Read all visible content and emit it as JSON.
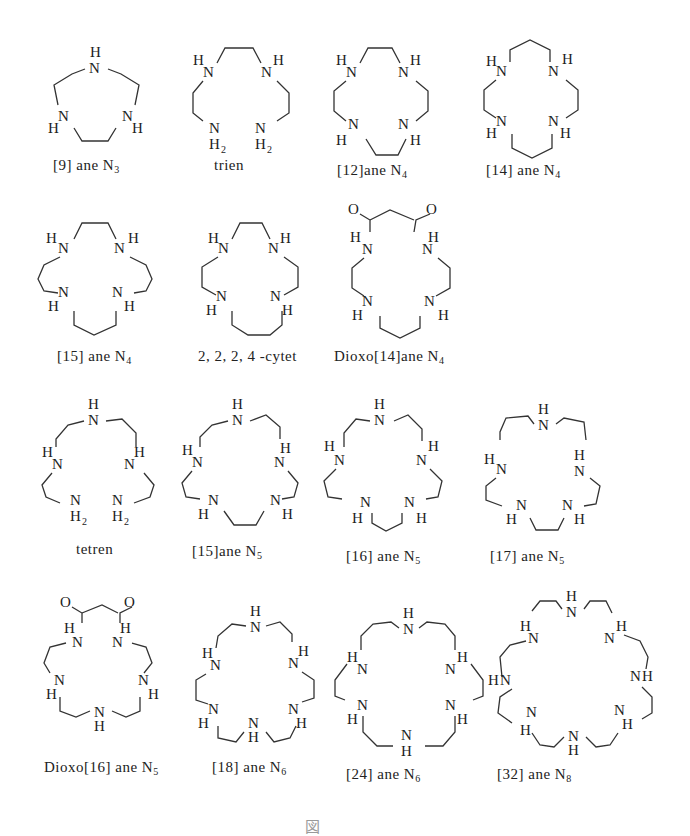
{
  "figure": {
    "rows": [
      {
        "compounds": [
          {
            "id": "9aneN3",
            "prefix": "[9] ane N",
            "sub": "3"
          },
          {
            "id": "trien",
            "prefix": "trien",
            "sub": ""
          },
          {
            "id": "12aneN4",
            "prefix": "[12]ane N",
            "sub": "4"
          },
          {
            "id": "14aneN4",
            "prefix": "[14] ane N",
            "sub": "4"
          }
        ]
      },
      {
        "compounds": [
          {
            "id": "15aneN4",
            "prefix": "[15] ane N",
            "sub": "4"
          },
          {
            "id": "cytet",
            "prefix": "2, 2, 2, 4 -cytet",
            "sub": ""
          },
          {
            "id": "dioxo14aneN4",
            "prefix": "Dioxo[14]ane N",
            "sub": "4"
          }
        ]
      },
      {
        "compounds": [
          {
            "id": "tetren",
            "prefix": "tetren",
            "sub": ""
          },
          {
            "id": "15aneN5",
            "prefix": "[15]ane N",
            "sub": "5"
          },
          {
            "id": "16aneN5",
            "prefix": "[16] ane N",
            "sub": "5"
          },
          {
            "id": "17aneN5",
            "prefix": "[17] ane N",
            "sub": "5"
          }
        ]
      },
      {
        "compounds": [
          {
            "id": "dioxo16aneN5",
            "prefix": "Dioxo[16] ane N",
            "sub": "5"
          },
          {
            "id": "18aneN6",
            "prefix": "[18] ane N",
            "sub": "6"
          },
          {
            "id": "24aneN6",
            "prefix": "[24] ane N",
            "sub": "6"
          },
          {
            "id": "32aneN8",
            "prefix": "[32] ane N",
            "sub": "8"
          }
        ]
      }
    ],
    "atoms": {
      "N": "N",
      "H": "H",
      "O": "O",
      "H2": "H",
      "two": "2"
    },
    "caption": "図"
  }
}
